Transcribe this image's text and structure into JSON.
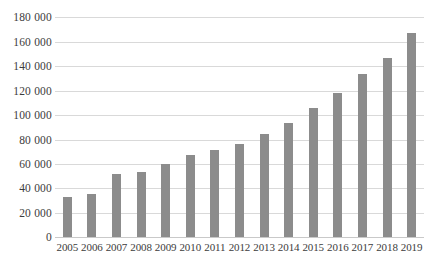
{
  "chart_data": {
    "type": "bar",
    "title": "",
    "xlabel": "",
    "ylabel": "",
    "categories": [
      "2005",
      "2006",
      "2007",
      "2008",
      "2009",
      "2010",
      "2011",
      "2012",
      "2013",
      "2014",
      "2015",
      "2016",
      "2017",
      "2018",
      "2019"
    ],
    "values": [
      33000,
      35000,
      51500,
      53000,
      60000,
      67000,
      71500,
      76500,
      84500,
      93500,
      105500,
      118000,
      133000,
      146500,
      167000
    ],
    "ylim": [
      0,
      180000
    ],
    "ytick_values": [
      0,
      20000,
      40000,
      60000,
      80000,
      100000,
      120000,
      140000,
      160000,
      180000
    ],
    "ytick_labels": [
      "0",
      "20 000",
      "40 000",
      "60 000",
      "80 000",
      "100 000",
      "120 000",
      "140 000",
      "160 000",
      "180 000"
    ],
    "grid": true,
    "legend": null,
    "bar_color": "#8c8c8c",
    "gridline_color": "#d9d9d9",
    "axis_color": "#c9c9c9",
    "background_color": "#ffffff"
  }
}
